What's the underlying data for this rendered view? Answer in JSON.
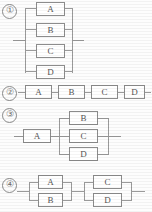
{
  "diagram": {
    "line_color": "#9a9a9a",
    "box_border_color": "#8c8c8c",
    "box_fill": "#ffffff",
    "text_color": "#555555",
    "background": "#fdfdfd",
    "items": [
      {
        "index": "①",
        "type": "parallel",
        "description": "Four blocks all in parallel",
        "blocks": [
          {
            "label": "A"
          },
          {
            "label": "B"
          },
          {
            "label": "C"
          },
          {
            "label": "D"
          }
        ]
      },
      {
        "index": "②",
        "type": "series",
        "description": "Four blocks all in series",
        "blocks": [
          {
            "label": "A"
          },
          {
            "label": "B"
          },
          {
            "label": "C"
          },
          {
            "label": "D"
          }
        ]
      },
      {
        "index": "③",
        "type": "series-parallel",
        "description": "Block A in series with B, C, D in parallel",
        "blocks": [
          {
            "label": "A"
          },
          {
            "label": "B"
          },
          {
            "label": "C"
          },
          {
            "label": "D"
          }
        ]
      },
      {
        "index": "④",
        "type": "parallel-series",
        "description": "A parallel B in series with C parallel D",
        "blocks": [
          {
            "label": "A"
          },
          {
            "label": "B"
          },
          {
            "label": "C"
          },
          {
            "label": "D"
          }
        ]
      }
    ]
  }
}
